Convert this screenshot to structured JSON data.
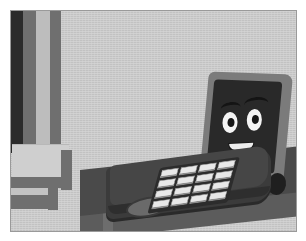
{
  "scene": {
    "title": "Smiling cartoon laptop on a desk",
    "description": "Illustration of a laptop computer with a happy cartoon face on its screen, sitting on a dark desk in a gray room with a doorway at the left",
    "style": "flat cartoon illustration, grayscale",
    "canvas": {
      "width": 306,
      "height": 241
    },
    "border": {
      "color": "#ffffff",
      "inset_px": 10
    }
  },
  "palette": {
    "wall": "#c8c8c8",
    "band_dark": "#2b2b2b",
    "band_mid": "#6f6f6f",
    "band_light": "#bdbdbd",
    "desk_top": "#4a4a4a",
    "desk_edge": "#7e7e7e",
    "desk_front": "#5c5c5c",
    "laptop_base": "#3b3b3b",
    "lid_bezel": "#7b7b7b",
    "screen": "#292929",
    "key_face": "#e8e8e8",
    "eye_white": "#f4f4f4",
    "pupil": "#161616",
    "teeth": "#ededed"
  },
  "background": {
    "wall_label": "room wall",
    "doorway_label": "doorway frame",
    "bands": [
      {
        "name": "band-dark",
        "color": "#2b2b2b"
      },
      {
        "name": "band-mid",
        "color": "#6f6f6f"
      },
      {
        "name": "band-light",
        "color": "#bdbdbd"
      },
      {
        "name": "band-mid2",
        "color": "#6f6f6f"
      }
    ],
    "furniture_label": "shelf unit"
  },
  "desk": {
    "label": "desk",
    "surface_label": "desk surface",
    "edge_label": "desk edge",
    "front_label": "desk front panel",
    "leg_label": "desk leg"
  },
  "laptop": {
    "label": "laptop computer",
    "base_label": "laptop base",
    "lid_label": "laptop lid",
    "screen_label": "laptop screen",
    "hinge_label": "hinge knob",
    "trackpad_label": "trackpad",
    "keyboard": {
      "label": "keyboard",
      "rows": 4,
      "columns": 4,
      "key_count": 16
    }
  },
  "face": {
    "label": "cartoon face",
    "expression": "smiling",
    "eyes": 2,
    "eye_left_label": "left eye",
    "eye_right_label": "right eye",
    "pupil_left_label": "left pupil",
    "pupil_right_label": "right pupil",
    "brow_left_label": "left eyebrow",
    "brow_right_label": "right eyebrow",
    "mouth_label": "smiling mouth",
    "teeth_label": "teeth"
  }
}
